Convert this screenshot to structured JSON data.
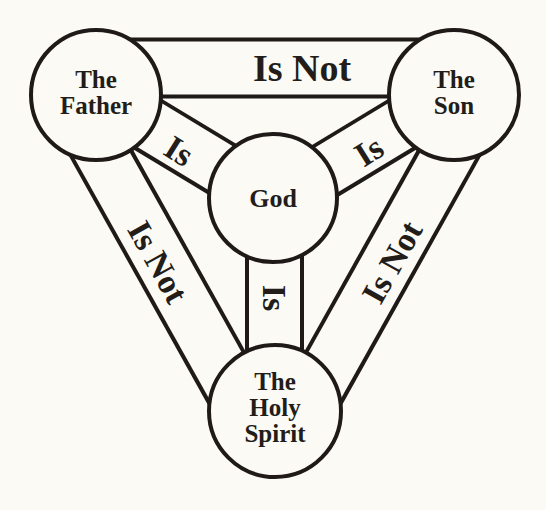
{
  "diagram": {
    "colors": {
      "background": "#fbfaf5",
      "ink": "#1f1a17"
    },
    "nodes": {
      "father": {
        "lines": [
          "The",
          "Father"
        ]
      },
      "son": {
        "lines": [
          "The",
          "Son"
        ]
      },
      "spirit": {
        "lines": [
          "The",
          "Holy",
          "Spirit"
        ]
      },
      "god": {
        "lines": [
          "God"
        ]
      }
    },
    "links": {
      "father_son": "Is Not",
      "father_spirit": "Is Not",
      "son_spirit": "Is Not",
      "father_god": "Is",
      "son_god": "Is",
      "spirit_god": "Is"
    }
  }
}
